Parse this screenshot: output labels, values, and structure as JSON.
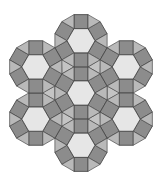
{
  "figure": {
    "title": "",
    "width": 160,
    "height": 180
  },
  "tiling": {
    "edge_length": 14,
    "rosette_spacing": 52.25,
    "rosette_centers": [
      [
        81,
        93
      ],
      [
        81,
        40.75
      ],
      [
        126.25,
        66.875
      ],
      [
        126.25,
        119.125
      ],
      [
        81,
        145.25
      ],
      [
        35.75,
        119.125
      ],
      [
        35.75,
        66.875
      ]
    ]
  },
  "colors": {
    "background": "#ffffff",
    "hexagon": "#e6e6e6",
    "square": "#8c8c8c",
    "triangle": "#b9b9b9",
    "gap_triangle": "#c4c4c4",
    "stroke": "#4a4a4a"
  }
}
